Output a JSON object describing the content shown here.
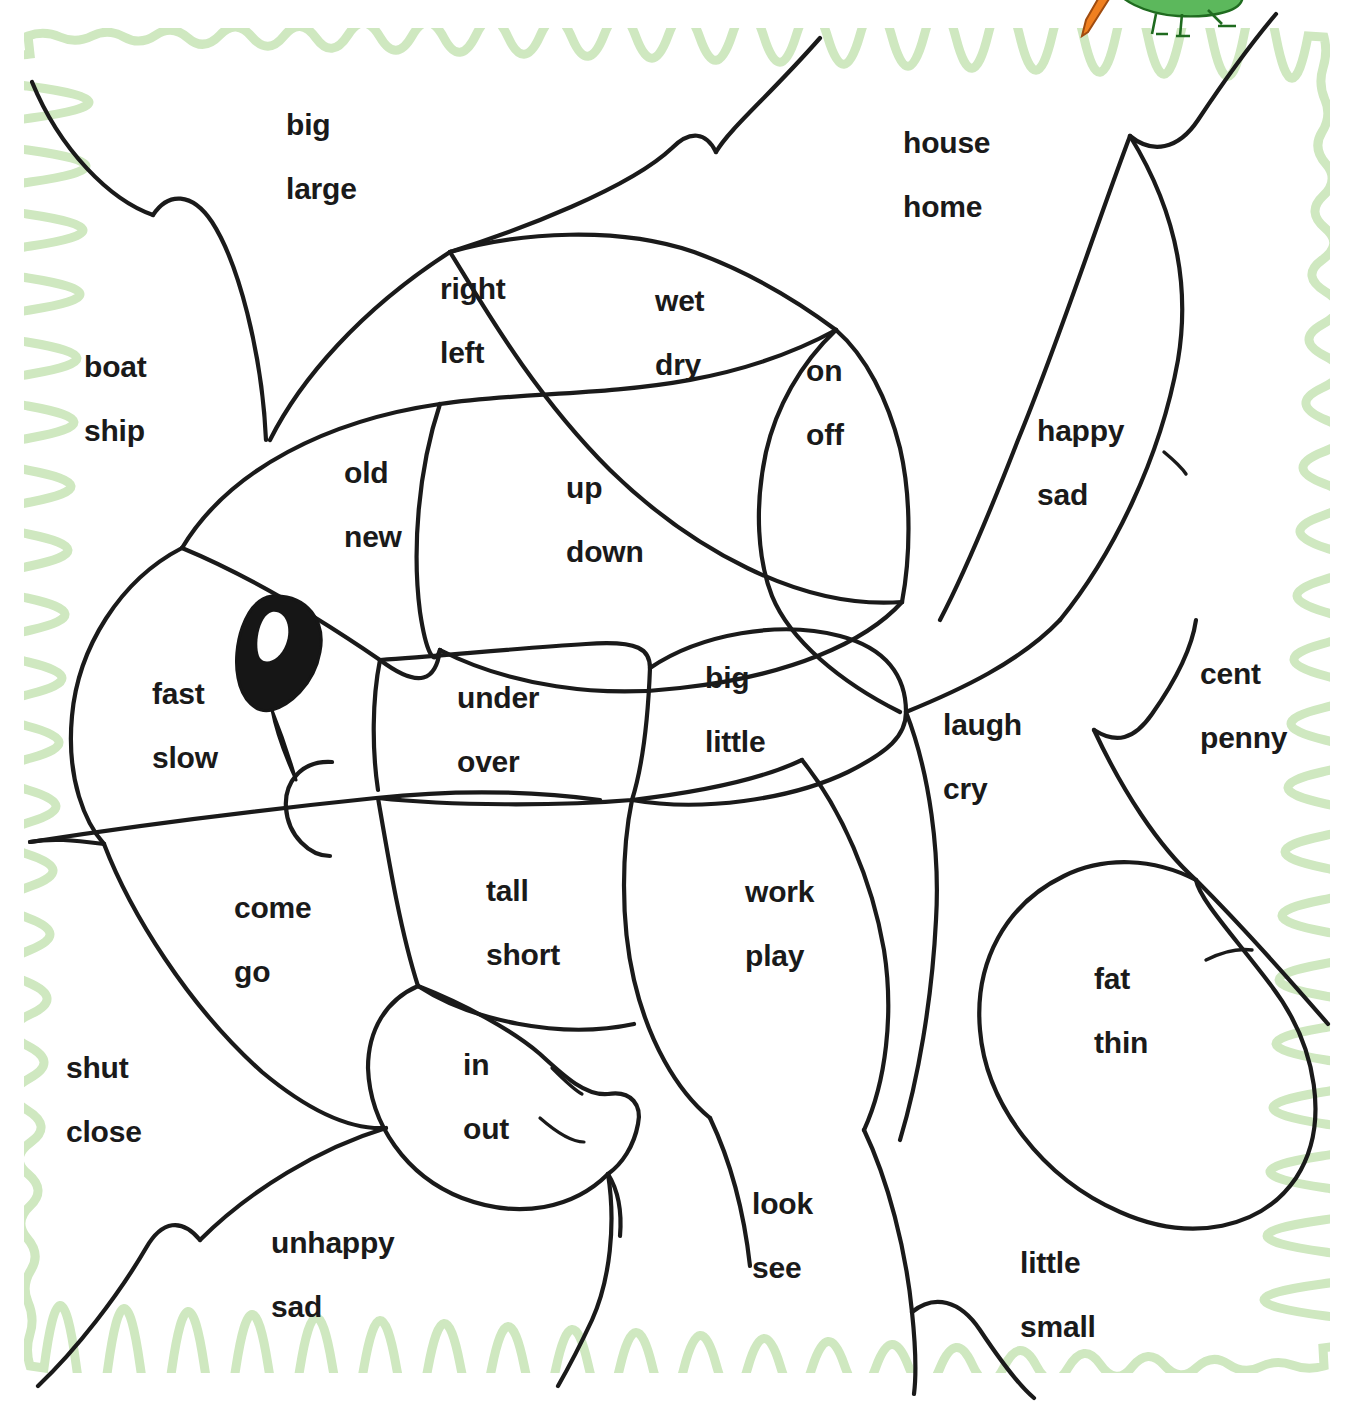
{
  "worksheet": {
    "title": "Fish Word Pairs Coloring Worksheet",
    "border_color": "#cfe8c0",
    "line_color": "#1a1a1a",
    "text_color": "#1a1a1a",
    "background_color": "#ffffff"
  },
  "mascot": {
    "name": "grasshopper-with-carrot",
    "body_color": "#5cb85c",
    "body_outline": "#1f6b1f",
    "carrot_color": "#f08020",
    "carrot_outline": "#a04c10"
  },
  "eye": {
    "name": "fish-eye",
    "fill_color": "#161616"
  },
  "word_pairs": [
    {
      "id": "big-large",
      "w1": "big",
      "w2": "large",
      "x": 286,
      "y": 110,
      "align": "left"
    },
    {
      "id": "house-home",
      "w1": "house",
      "w2": "home",
      "x": 903,
      "y": 128,
      "align": "left"
    },
    {
      "id": "right-left",
      "w1": "right",
      "w2": "left",
      "x": 440,
      "y": 274,
      "align": "left"
    },
    {
      "id": "wet-dry",
      "w1": "wet",
      "w2": "dry",
      "x": 655,
      "y": 286,
      "align": "left"
    },
    {
      "id": "on-off",
      "w1": "on",
      "w2": "off",
      "x": 806,
      "y": 356,
      "align": "left"
    },
    {
      "id": "boat-ship",
      "w1": "boat",
      "w2": "ship",
      "x": 84,
      "y": 352,
      "align": "left"
    },
    {
      "id": "happy-sad",
      "w1": "happy",
      "w2": "sad",
      "x": 1037,
      "y": 416,
      "align": "left"
    },
    {
      "id": "old-new",
      "w1": "old",
      "w2": "new",
      "x": 344,
      "y": 458,
      "align": "left"
    },
    {
      "id": "up-down",
      "w1": "up",
      "w2": "down",
      "x": 566,
      "y": 473,
      "align": "left"
    },
    {
      "id": "fast-slow",
      "w1": "fast",
      "w2": "slow",
      "x": 152,
      "y": 679,
      "align": "left"
    },
    {
      "id": "under-over",
      "w1": "under",
      "w2": "over",
      "x": 457,
      "y": 683,
      "align": "left"
    },
    {
      "id": "big-little",
      "w1": "big",
      "w2": "little",
      "x": 705,
      "y": 663,
      "align": "left"
    },
    {
      "id": "cent-penny",
      "w1": "cent",
      "w2": "penny",
      "x": 1200,
      "y": 659,
      "align": "left"
    },
    {
      "id": "laugh-cry",
      "w1": "laugh",
      "w2": "cry",
      "x": 943,
      "y": 710,
      "align": "left"
    },
    {
      "id": "come-go",
      "w1": "come",
      "w2": "go",
      "x": 234,
      "y": 893,
      "align": "left"
    },
    {
      "id": "tall-short",
      "w1": "tall",
      "w2": "short",
      "x": 486,
      "y": 876,
      "align": "left"
    },
    {
      "id": "work-play",
      "w1": "work",
      "w2": "play",
      "x": 745,
      "y": 877,
      "align": "left"
    },
    {
      "id": "fat-thin",
      "w1": "fat",
      "w2": "thin",
      "x": 1094,
      "y": 964,
      "align": "left"
    },
    {
      "id": "in-out",
      "w1": "in",
      "w2": "out",
      "x": 463,
      "y": 1050,
      "align": "left"
    },
    {
      "id": "shut-close",
      "w1": "shut",
      "w2": "close",
      "x": 66,
      "y": 1053,
      "align": "left"
    },
    {
      "id": "look-see",
      "w1": "look",
      "w2": "see",
      "x": 752,
      "y": 1189,
      "align": "left"
    },
    {
      "id": "unhappy-sad",
      "w1": "unhappy",
      "w2": "sad",
      "x": 271,
      "y": 1228,
      "align": "left"
    },
    {
      "id": "little-small",
      "w1": "little",
      "w2": "small",
      "x": 1020,
      "y": 1248,
      "align": "left"
    }
  ]
}
